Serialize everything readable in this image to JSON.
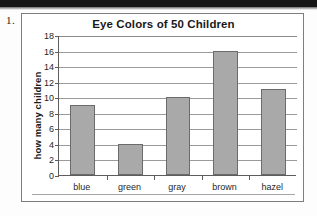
{
  "worksheet": {
    "item_number": "1."
  },
  "chart_data": {
    "type": "bar",
    "title": "Eye Colors of 50 Children",
    "xlabel": "",
    "ylabel": "how many children",
    "categories": [
      "blue",
      "green",
      "gray",
      "brown",
      "hazel"
    ],
    "values": [
      9,
      4,
      10,
      16,
      11
    ],
    "ylim": [
      0,
      18
    ],
    "ytick_step": 2,
    "yticks": [
      0,
      2,
      4,
      6,
      8,
      10,
      12,
      14,
      16,
      18
    ],
    "ytick_labels": [
      "0",
      "2",
      "4",
      "6",
      "8",
      "10",
      "12",
      "14",
      "16",
      "18"
    ],
    "grid": true,
    "grid_axis": "y",
    "legend": false,
    "legend_position": "none",
    "bar_color": "#a9a9a9",
    "bar_border_color": "#6b6b6b",
    "gridline_color": "#9a9a9a",
    "axis_color": "#5d5d5d",
    "frame_color": "#7d7d7d",
    "text_color": "#1a1a1a",
    "total": 50
  }
}
